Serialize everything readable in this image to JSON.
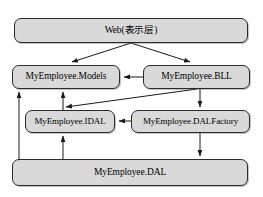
{
  "diagram": {
    "type": "layered-architecture",
    "colors": {
      "node_fill": "#d9d9d9",
      "node_stroke": "#2b2b2b",
      "edge_stroke": "#1a1a1a",
      "background": "#ffffff",
      "text": "#000000"
    },
    "nodes": [
      {
        "id": "web",
        "label": "Web(表示层)",
        "layer": 1
      },
      {
        "id": "models",
        "label": "MyEmployee.Models",
        "layer": 2
      },
      {
        "id": "bll",
        "label": "MyEmployee.BLL",
        "layer": 2
      },
      {
        "id": "idal",
        "label": "MyEmployee.IDAL",
        "layer": 3
      },
      {
        "id": "dalfactory",
        "label": "MyEmployee.DALFactory",
        "layer": 3
      },
      {
        "id": "dal",
        "label": "MyEmployee.DAL",
        "layer": 4
      }
    ],
    "edges": [
      {
        "from": "web",
        "to": "models",
        "style": "solid-arrow"
      },
      {
        "from": "web",
        "to": "bll",
        "style": "solid-arrow"
      },
      {
        "from": "bll",
        "to": "models",
        "style": "solid-arrow"
      },
      {
        "from": "bll",
        "to": "idal",
        "style": "solid-arrow"
      },
      {
        "from": "bll",
        "to": "dalfactory",
        "style": "solid-arrow"
      },
      {
        "from": "dalfactory",
        "to": "idal",
        "style": "solid-arrow"
      },
      {
        "from": "dalfactory",
        "to": "dal",
        "style": "solid-arrow"
      },
      {
        "from": "idal",
        "to": "models",
        "style": "solid-arrow"
      },
      {
        "from": "dal",
        "to": "models",
        "style": "solid-arrow"
      },
      {
        "from": "dal",
        "to": "idal",
        "style": "solid-arrow"
      }
    ]
  }
}
